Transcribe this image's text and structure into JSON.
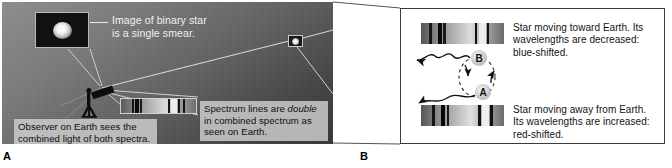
{
  "figure": {
    "background_color": "#ffffff"
  },
  "panel_a": {
    "letter": "A",
    "background_colors": [
      "#8e8e8e",
      "#5e5e5e",
      "#343434"
    ],
    "star_inset": {
      "name": "telescope image of binary star",
      "background_color": "#111111",
      "border_color": "#b9b9b9"
    },
    "distant_star": {
      "name": "unresolved binary star in sky",
      "border_color": "#c9c9c9"
    },
    "labels": {
      "binary_star_image": "Image of binary star is a single smear.",
      "binary_star_image_line1": "Image of binary star",
      "binary_star_image_line2": "is a single smear."
    },
    "plates": [
      {
        "id": "observer",
        "line1": "Observer on Earth sees the",
        "line2": "combined light of both spectra.",
        "text": "Observer on Earth sees the combined light of both spectra.",
        "background_color": "#cdcdcd"
      },
      {
        "id": "spectrum-lines",
        "line1_pre": "Spectrum lines are ",
        "line1_em": "double",
        "line2": "in combined spectrum as",
        "line3": "seen on Earth.",
        "text": "Spectrum lines are double in combined spectrum as seen on Earth.",
        "background_color": "#cdcdcd"
      }
    ],
    "telescope": {
      "name": "observer telescope on tripod",
      "color": "#0d0d0d"
    },
    "combined_spectrum": {
      "name": "combined spectrum with doubled absorption lines",
      "border_color": "#d0d0d0",
      "gradient_stops": [
        "#5a5a5a",
        "#8c8c8c",
        "#b5b5b5",
        "#dcdcdc",
        "#9a9a9a",
        "#6e6e6e"
      ],
      "absorption_lines": [
        {
          "position_pct": 14,
          "width_pct": 3.2,
          "color": "#161616"
        },
        {
          "position_pct": 19,
          "width_pct": 4.5,
          "color": "#0c0c0c"
        },
        {
          "position_pct": 25,
          "width_pct": 3.0,
          "color": "#1c1c1c"
        },
        {
          "position_pct": 63,
          "width_pct": 2.6,
          "color": "#141414"
        },
        {
          "position_pct": 76,
          "width_pct": 2.8,
          "color": "#101010"
        },
        {
          "position_pct": 82,
          "width_pct": 3.0,
          "color": "#151515"
        }
      ],
      "bright_band": {
        "position_pct": 67,
        "width_pct": 8,
        "color": "#ececec"
      }
    }
  },
  "panel_b": {
    "letter": "B",
    "border_color": "#3a3a3a",
    "background_color": "#ffffff",
    "orbit": {
      "name": "binary orbit with stars A and B",
      "star_a_label": "A",
      "star_b_label": "B",
      "orbit_style": "dashed ellipse",
      "star_a_color": "#d8d8d8",
      "star_b_color": "#d8d8d8",
      "light_wave_color": "#111111"
    },
    "spectra": [
      {
        "id": "blue-shifted",
        "name": "blue-shifted spectrum",
        "gradient_stops": [
          "#535353",
          "#8a8a8a",
          "#b2b2b2",
          "#dedede",
          "#a0a0a0",
          "#6a6a6a"
        ],
        "absorption_lines": [
          {
            "position_pct": 10,
            "width_pct": 3.5,
            "color": "#151515"
          },
          {
            "position_pct": 20,
            "width_pct": 5.0,
            "color": "#090909"
          },
          {
            "position_pct": 27,
            "width_pct": 3.2,
            "color": "#1a1a1a"
          },
          {
            "position_pct": 65,
            "width_pct": 3.0,
            "color": "#121212"
          },
          {
            "position_pct": 79,
            "width_pct": 3.4,
            "color": "#0f0f0f"
          }
        ],
        "bright_band": {
          "position_pct": 70,
          "width_pct": 8,
          "color": "#eeeeee"
        }
      },
      {
        "id": "red-shifted",
        "name": "red-shifted spectrum",
        "gradient_stops": [
          "#545454",
          "#8b8b8b",
          "#b4b4b4",
          "#e0e0e0",
          "#a2a2a2",
          "#6b6b6b"
        ],
        "absorption_lines": [
          {
            "position_pct": 13,
            "width_pct": 3.5,
            "color": "#151515"
          },
          {
            "position_pct": 24,
            "width_pct": 5.0,
            "color": "#090909"
          },
          {
            "position_pct": 31,
            "width_pct": 3.2,
            "color": "#1a1a1a"
          },
          {
            "position_pct": 69,
            "width_pct": 3.0,
            "color": "#121212"
          },
          {
            "position_pct": 83,
            "width_pct": 3.4,
            "color": "#0f0f0f"
          }
        ],
        "bright_band": {
          "position_pct": 74,
          "width_pct": 8,
          "color": "#eeeeee"
        }
      }
    ],
    "captions": [
      {
        "id": "blue",
        "line1": "Star moving toward Earth. Its",
        "line2": "wavelengths are decreased:",
        "line3": "blue-shifted.",
        "text": "Star moving toward Earth. Its wavelengths are decreased: blue-shifted."
      },
      {
        "id": "red",
        "line1": "Star moving away from Earth.",
        "line2": "Its wavelengths are increased:",
        "line3": "red-shifted.",
        "text": "Star moving away from Earth. Its wavelengths are increased: red-shifted."
      }
    ]
  }
}
